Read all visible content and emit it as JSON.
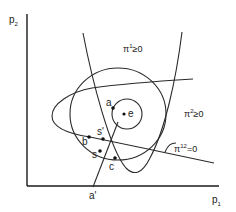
{
  "figure": {
    "axes": {
      "y_label": "p",
      "y_label_sub": "2",
      "x_label": "p",
      "x_label_sub": "1"
    },
    "region_labels": {
      "pi1": {
        "base": "π",
        "sup": "1",
        "rest": "≥0"
      },
      "pi2": {
        "base": "π",
        "sup": "2",
        "rest": "≥0"
      },
      "pi12": {
        "base": "π",
        "sup": "12",
        "rest": "=0"
      }
    },
    "points": {
      "a": "a",
      "e": "e",
      "s_upper": "s'",
      "b": "b",
      "s_lower": "s",
      "c": "c",
      "a_prime": "a'"
    },
    "colors": {
      "ink": "#222222",
      "background": "#ffffff"
    }
  }
}
